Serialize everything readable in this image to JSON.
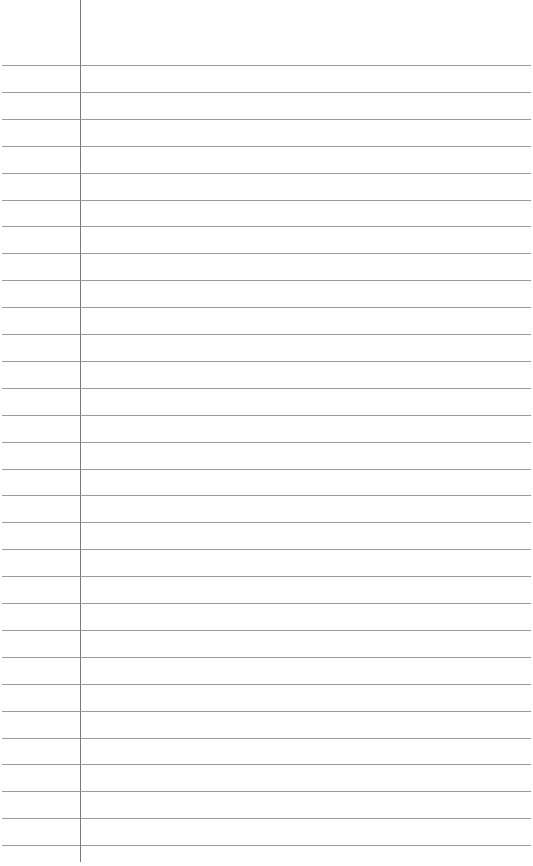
{
  "paper": {
    "background": "#ffffff",
    "rule_color": "#8a8a8a",
    "margin_color": "#7a7a7a",
    "margin_x": 80,
    "first_rule_y": 65,
    "rule_spacing": 26.9,
    "rule_count": 30
  }
}
